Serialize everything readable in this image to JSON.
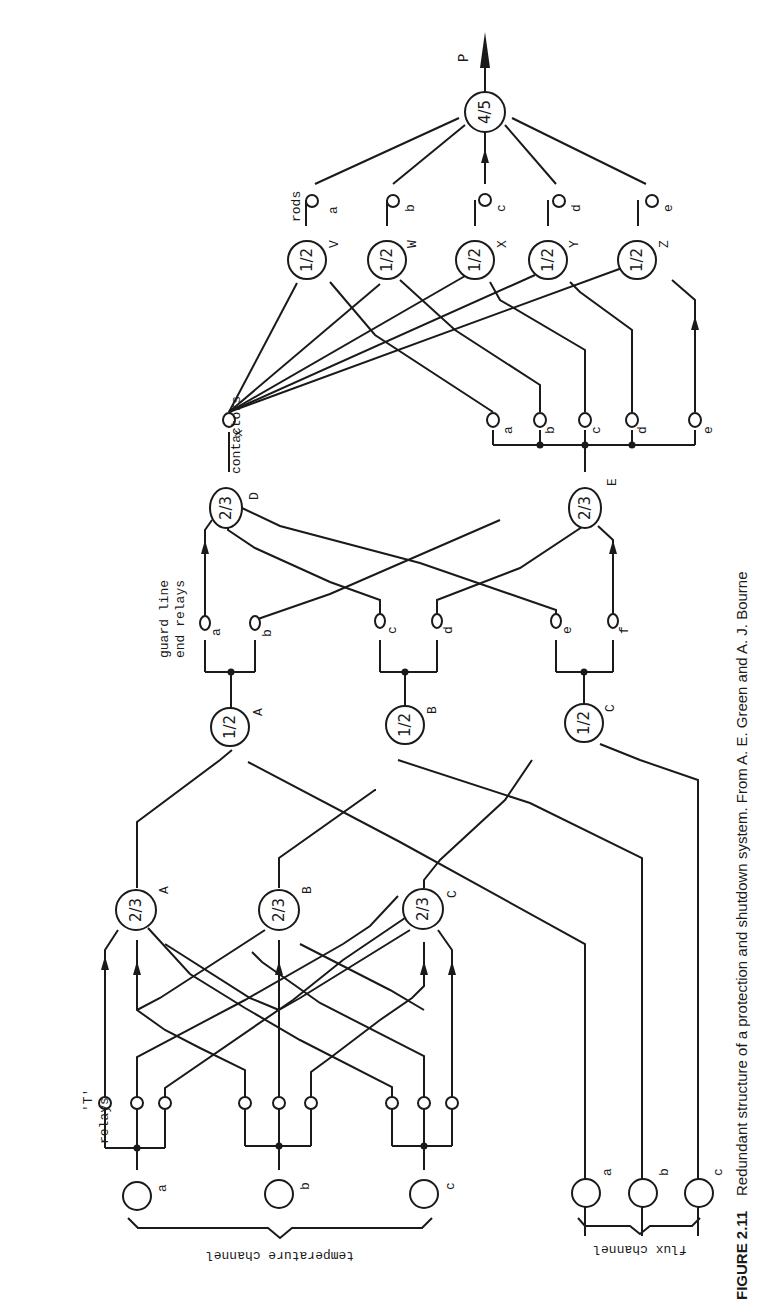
{
  "figure": {
    "orientation": "rotated 90 degrees counter-clockwise",
    "caption": {
      "label": "FIGURE 2.11",
      "text": "Redundant structure of a protection and shutdown system. From A. E. Green and A. J. Bourne"
    },
    "groups": {
      "temperature_channel": "temperature channel",
      "flux_channel": "flux channel",
      "t_relays_line1": "'T'",
      "t_relays_line2": "relays",
      "guard_line1": "guard line",
      "guard_line2": "end relays",
      "contactors": "contactors",
      "rods": "rods"
    },
    "sensors": {
      "temperature": [
        "a",
        "b",
        "c"
      ],
      "flux": [
        "a",
        "b",
        "c"
      ]
    },
    "vote_2of3_temp": [
      {
        "label": "A",
        "logic": "2/3"
      },
      {
        "label": "B",
        "logic": "2/3"
      },
      {
        "label": "C",
        "logic": "2/3"
      }
    ],
    "vote_1of2": [
      {
        "label": "A",
        "logic": "1/2"
      },
      {
        "label": "B",
        "logic": "1/2"
      },
      {
        "label": "C",
        "logic": "1/2"
      }
    ],
    "guard_relays": [
      "a",
      "b",
      "c",
      "d",
      "e",
      "f"
    ],
    "vote_2of3_guard": [
      {
        "label": "D",
        "logic": "2/3"
      },
      {
        "label": "E",
        "logic": "2/3"
      }
    ],
    "contactor_x": "x",
    "contactor_relays": [
      "a",
      "b",
      "c",
      "d",
      "e"
    ],
    "vote_1of2_rods": [
      {
        "label": "V",
        "logic": "1/2"
      },
      {
        "label": "W",
        "logic": "1/2"
      },
      {
        "label": "X",
        "logic": "1/2"
      },
      {
        "label": "Y",
        "logic": "1/2"
      },
      {
        "label": "Z",
        "logic": "1/2"
      }
    ],
    "rods": [
      "a",
      "b",
      "c",
      "d",
      "e"
    ],
    "final_vote": {
      "logic": "4/5",
      "output": "P"
    }
  }
}
